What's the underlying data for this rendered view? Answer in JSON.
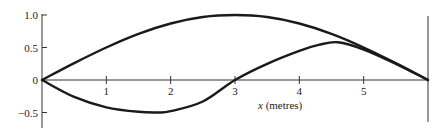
{
  "chart_data": {
    "type": "line",
    "title": "",
    "xlabel_var": "x",
    "xlabel_unit": " (metres)",
    "ylabel": "",
    "xlim": [
      0,
      6
    ],
    "ylim": [
      -0.65,
      1.05
    ],
    "x_ticks": [
      {
        "value": 1,
        "label": "1"
      },
      {
        "value": 2,
        "label": "2"
      },
      {
        "value": 3,
        "label": "3"
      },
      {
        "value": 4,
        "label": "4"
      },
      {
        "value": 5,
        "label": "5"
      }
    ],
    "y_ticks": [
      {
        "value": 1.0,
        "label": "1.0"
      },
      {
        "value": 0.5,
        "label": "0.5"
      },
      {
        "value": 0,
        "label": "0"
      },
      {
        "value": -0.5,
        "label": "−0.5"
      }
    ],
    "grid": false,
    "legend": null,
    "series": [
      {
        "name": "upper curve",
        "x": [
          0,
          0.5,
          1,
          1.5,
          2,
          2.5,
          3,
          3.5,
          4,
          4.5,
          5,
          5.5,
          6
        ],
        "y": [
          0,
          0.26,
          0.5,
          0.71,
          0.87,
          0.97,
          1.0,
          0.97,
          0.87,
          0.71,
          0.5,
          0.26,
          0
        ]
      },
      {
        "name": "lower curve",
        "x": [
          0,
          0.5,
          1,
          1.5,
          1.8,
          2,
          2.5,
          3,
          3.5,
          4,
          4.3,
          4.6,
          5,
          5.5,
          6
        ],
        "y": [
          0,
          -0.26,
          -0.42,
          -0.49,
          -0.5,
          -0.48,
          -0.33,
          0,
          0.25,
          0.45,
          0.54,
          0.58,
          0.47,
          0.25,
          0
        ]
      }
    ]
  }
}
